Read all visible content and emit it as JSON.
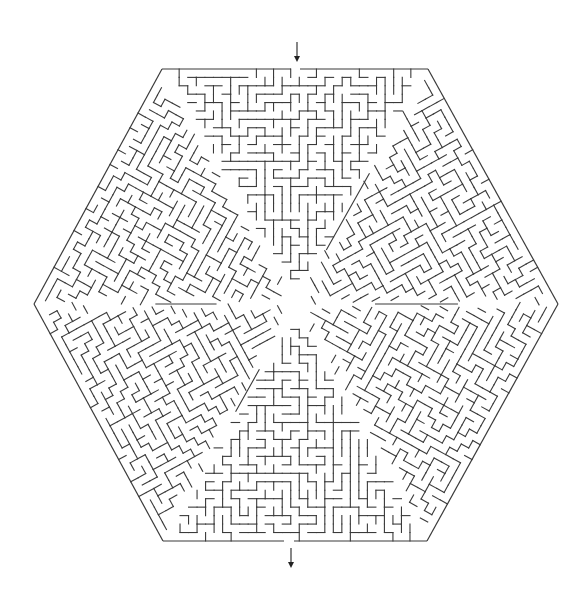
{
  "canvas": {
    "width": 581,
    "height": 597,
    "background": "#ffffff"
  },
  "maze": {
    "shape": "hexagon",
    "sectors": 6,
    "vertices": [
      [
        162,
        69
      ],
      [
        428,
        69
      ],
      [
        558,
        304
      ],
      [
        427,
        541
      ],
      [
        163,
        541
      ],
      [
        34,
        304
      ]
    ],
    "center": [
      296,
      304
    ],
    "cell_size": 8.6,
    "seed": 20240611,
    "wall_color": "#3a3a3a",
    "entrance": {
      "edge": 0,
      "gap_x": [
        291,
        300
      ]
    },
    "exit": {
      "edge": 3,
      "gap_x": [
        284,
        294
      ]
    }
  },
  "arrows": {
    "entry": {
      "x": 297,
      "y1": 42,
      "y2": 62,
      "direction": "down",
      "color": "#222222"
    },
    "exit": {
      "x": 291,
      "y1": 548,
      "y2": 568,
      "direction": "down",
      "color": "#222222"
    }
  }
}
